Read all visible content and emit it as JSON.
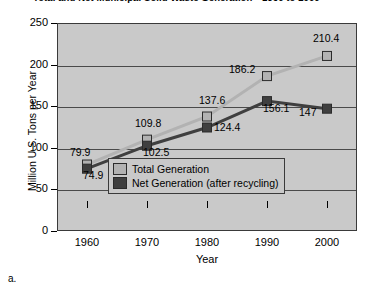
{
  "caption": "a.",
  "legend": {
    "position": "inside-lower-center",
    "items": [
      {
        "label": "Total Generation",
        "color": "#b2b2b2"
      },
      {
        "label": "Net Generation (after recycling)",
        "color": "#3f3f3f"
      }
    ]
  },
  "colors": {
    "plot_background": "#c9c9c9",
    "frame": "#3a3a3a",
    "total_series": "#b2b2b2",
    "net_series": "#3f3f3f",
    "gridline": "#4a4a4a"
  },
  "chart_data": {
    "type": "line",
    "title": "Total and Net Municipal Solid Waste Generation—1960 to 2000",
    "xlabel": "Year",
    "ylabel": "Million U.S. Tons per Year",
    "categories": [
      "1960",
      "1970",
      "1980",
      "1990",
      "2000"
    ],
    "xticklabels": [
      "1960",
      "1970",
      "1980",
      "1990",
      "2000"
    ],
    "yticklabels": [
      "0",
      "50",
      "100",
      "150",
      "200",
      "250"
    ],
    "ylim": [
      0,
      250
    ],
    "ytick_interval": 50,
    "grid": true,
    "gridlines_at": [
      50,
      100,
      150,
      200
    ],
    "marker": "square",
    "series": [
      {
        "name": "Total Generation",
        "color": "#b2b2b2",
        "values": [
          79.9,
          109.8,
          137.6,
          186.2,
          210.4
        ],
        "labels": [
          "79.9",
          "109.8",
          "137.6",
          "186.2",
          "210.4"
        ]
      },
      {
        "name": "Net Generation (after recycling)",
        "color": "#3f3f3f",
        "values": [
          74.9,
          102.5,
          124.4,
          156.1,
          147
        ],
        "labels": [
          "74.9",
          "102.5",
          "124.4",
          "156.1",
          "147"
        ]
      }
    ]
  }
}
